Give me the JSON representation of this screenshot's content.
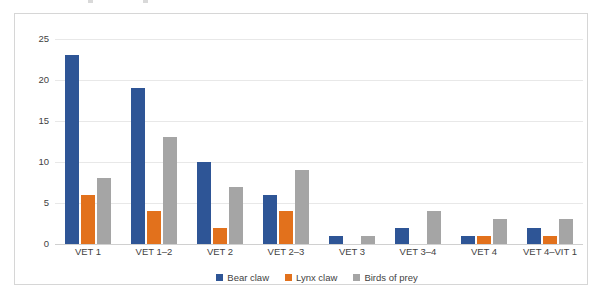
{
  "chart_data": {
    "type": "bar",
    "title": "",
    "subtitle": "",
    "xlabel": "",
    "ylabel": "",
    "ylim": [
      0,
      25
    ],
    "yticks": [
      0,
      5,
      10,
      15,
      20,
      25
    ],
    "ytick_labels": [
      "0",
      "5",
      "10",
      "15",
      "20",
      "25"
    ],
    "grid": true,
    "grid_axis": "y",
    "legend_position": "bottom-center",
    "orientation": "vertical",
    "grouping": "grouped",
    "categories": [
      "VET 1",
      "VET 1–2",
      "VET 2",
      "VET 2–3",
      "VET 3",
      "VET 3–4",
      "VET 4",
      "VET 4–VIT 1"
    ],
    "series": [
      {
        "name": "Bear claw",
        "color": "#2e5596",
        "values": [
          23,
          19,
          10,
          6,
          1,
          2,
          1,
          2
        ]
      },
      {
        "name": "Lynx claw",
        "color": "#e2711c",
        "values": [
          6,
          4,
          2,
          4,
          0,
          0,
          1,
          1
        ]
      },
      {
        "name": "Birds of prey",
        "color": "#a5a5a5",
        "values": [
          8,
          13,
          7,
          9,
          1,
          4,
          3,
          3
        ]
      }
    ]
  },
  "legend": {
    "items": [
      {
        "label": "Bear claw",
        "color": "#2e5596"
      },
      {
        "label": "Lynx claw",
        "color": "#e2711c"
      },
      {
        "label": "Birds of prey",
        "color": "#a5a5a5"
      }
    ]
  },
  "colors": {
    "bear_claw": "#2e5596",
    "lynx_claw": "#e2711c",
    "birds_of_prey": "#a5a5a5",
    "gridline": "#e8e8e8",
    "axis": "#d0d0d0",
    "frame_border": "#d6d6d6",
    "text": "#3f3f3f",
    "background": "#ffffff"
  }
}
